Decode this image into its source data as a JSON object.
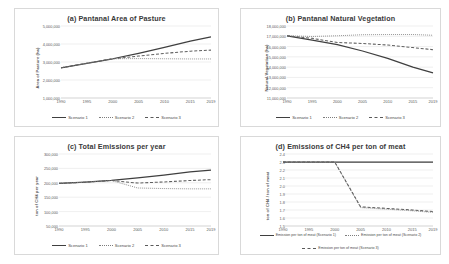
{
  "figure": {
    "panels": [
      "a",
      "b",
      "c",
      "d"
    ]
  },
  "chart_data": [
    {
      "id": "a",
      "type": "line",
      "title": "(a) Pantanal Area of Pasture",
      "xlabel": "",
      "ylabel": "Area of Pasture (ha)",
      "x": [
        1990,
        1995,
        2000,
        2005,
        2010,
        2015,
        2019
      ],
      "xlim": [
        1990,
        2019
      ],
      "ylim": [
        1000000,
        5000000
      ],
      "yticks": [
        1000000,
        2000000,
        3000000,
        4000000,
        5000000
      ],
      "yticklabels": [
        "1,000,000",
        "2,000,000",
        "3,000,000",
        "4,000,000",
        "5,000,000"
      ],
      "xticklabels": [
        "1990",
        "1995",
        "2000",
        "2005",
        "2010",
        "2015",
        "2019"
      ],
      "grid": true,
      "legend_position": "bottom",
      "series": [
        {
          "name": "Scenario 1",
          "style": "solid",
          "values": [
            2680000,
            2930000,
            3180000,
            3480000,
            3810000,
            4160000,
            4390000
          ]
        },
        {
          "name": "Scenario 2",
          "style": "dotted",
          "values": [
            2680000,
            2930000,
            3180000,
            3190000,
            3180000,
            3170000,
            3170000
          ]
        },
        {
          "name": "Scenario 3",
          "style": "dashed",
          "values": [
            2680000,
            2930000,
            3180000,
            3330000,
            3480000,
            3600000,
            3660000
          ]
        }
      ]
    },
    {
      "id": "b",
      "type": "line",
      "title": "(b) Pantanal Natural Vegetation",
      "xlabel": "",
      "ylabel": "Natural Vegetation (ha)",
      "x": [
        1990,
        1995,
        2000,
        2005,
        2010,
        2015,
        2019
      ],
      "xlim": [
        1990,
        2019
      ],
      "ylim": [
        11000000,
        18000000
      ],
      "yticks": [
        11000000,
        12000000,
        13000000,
        14000000,
        15000000,
        16000000,
        17000000,
        18000000
      ],
      "yticklabels": [
        "11,000,000",
        "12,000,000",
        "13,000,000",
        "14,000,000",
        "15,000,000",
        "16,000,000",
        "17,000,000",
        "18,000,000"
      ],
      "xticklabels": [
        "1990",
        "1995",
        "2000",
        "2005",
        "2010",
        "2015",
        "2019"
      ],
      "grid": true,
      "legend_position": "bottom",
      "series": [
        {
          "name": "Scenario 1",
          "style": "solid",
          "values": [
            17050000,
            16620000,
            16180000,
            15570000,
            14850000,
            14000000,
            13450000
          ]
        },
        {
          "name": "Scenario 2",
          "style": "dotted",
          "values": [
            17050000,
            16980000,
            17050000,
            17150000,
            17170000,
            17170000,
            17100000
          ]
        },
        {
          "name": "Scenario 3",
          "style": "dashed",
          "values": [
            17050000,
            16800000,
            16400000,
            16300000,
            16150000,
            15900000,
            15700000
          ]
        }
      ]
    },
    {
      "id": "c",
      "type": "line",
      "title": "(c) Total Emissions per year",
      "xlabel": "",
      "ylabel": "ton of CH4 per year",
      "x": [
        1990,
        1995,
        2000,
        2005,
        2010,
        2015,
        2019
      ],
      "xlim": [
        1990,
        2019
      ],
      "ylim": [
        50000,
        300000
      ],
      "yticks": [
        50000,
        100000,
        150000,
        200000,
        250000,
        300000
      ],
      "yticklabels": [
        "50,000",
        "100,000",
        "150,000",
        "200,000",
        "250,000",
        "300,000"
      ],
      "xticklabels": [
        "1990",
        "1995",
        "2000",
        "2005",
        "2010",
        "2015",
        "2019"
      ],
      "grid": true,
      "legend_position": "bottom",
      "series": [
        {
          "name": "Scenario 1",
          "style": "solid",
          "values": [
            198000,
            202000,
            208000,
            217000,
            227000,
            238000,
            244000
          ]
        },
        {
          "name": "Scenario 2",
          "style": "dotted",
          "values": [
            198000,
            202000,
            208000,
            182000,
            180000,
            179000,
            179000
          ]
        },
        {
          "name": "Scenario 3",
          "style": "dashed",
          "values": [
            198000,
            202000,
            208000,
            199000,
            203000,
            208000,
            211000
          ]
        }
      ]
    },
    {
      "id": "d",
      "type": "line",
      "title": "(d) Emissions of CH4 per ton of meat",
      "xlabel": "",
      "ylabel": "ton of CH4 / ton of meat",
      "x": [
        1990,
        1995,
        2000,
        2005,
        2010,
        2015,
        2019
      ],
      "xlim": [
        1990,
        2019
      ],
      "ylim": [
        1.5,
        2.4
      ],
      "yticks": [
        1.5,
        1.6,
        1.7,
        1.8,
        1.9,
        2.0,
        2.1,
        2.2,
        2.3,
        2.4
      ],
      "yticklabels": [
        "1.5",
        "1.6",
        "1.7",
        "1.8",
        "1.9",
        "2.0",
        "2.1",
        "2.2",
        "2.3",
        "2.4"
      ],
      "xticklabels": [
        "1990",
        "1995",
        "2000",
        "2005",
        "2010",
        "2015",
        "2019"
      ],
      "grid": true,
      "legend_position": "bottom",
      "series": [
        {
          "name": "Emission per ton of meat (Scenario 1)",
          "style": "solid",
          "values": [
            2.3,
            2.3,
            2.3,
            2.3,
            2.3,
            2.3,
            2.3
          ]
        },
        {
          "name": "Emission per ton of meat (Scenario 2)",
          "style": "dotted",
          "values": [
            2.3,
            2.3,
            2.3,
            1.73,
            1.71,
            1.69,
            1.67
          ]
        },
        {
          "name": "Emission per ton of meat (Scenario 3)",
          "style": "dashed",
          "values": [
            2.3,
            2.3,
            2.3,
            1.74,
            1.72,
            1.7,
            1.68
          ]
        }
      ]
    }
  ]
}
